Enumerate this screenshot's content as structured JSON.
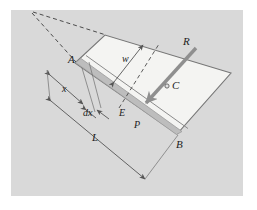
{
  "figure": {
    "background_color": "#ffffff",
    "panel_color": "#d9d9d9",
    "plate_fill": "#f2f2f0",
    "strip_fill": "#c0c0c0",
    "line_color": "#7a7a7a",
    "arrow_color": "#8a8a8a",
    "label_color": "#1c1c1c"
  },
  "labels": {
    "corner_a": "A",
    "corner_b": "B",
    "centroid": "C",
    "resultant": "R",
    "element": "E",
    "strip": "P",
    "width": "w",
    "distance_x": "x",
    "element_width": "dx",
    "length_l": "L"
  },
  "annotations": {
    "dimension_lines": [
      "w",
      "x",
      "dx",
      "L"
    ],
    "points": [
      "A",
      "B",
      "C",
      "E"
    ],
    "force_vector": "R",
    "shaded_strip": "P"
  }
}
